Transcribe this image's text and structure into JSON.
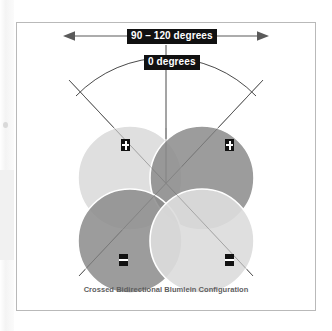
{
  "figure": {
    "caption": "Crossed Bidirectional Blumlein Configuration",
    "labels": {
      "angle_range": "90 – 120 degrees",
      "zero_axis": "0 degrees"
    },
    "icons": {
      "left_arrow": "arrow-left-icon",
      "right_arrow": "arrow-right-icon",
      "arc": "arc-icon"
    },
    "polarity_markers": [
      {
        "id": "top-left",
        "sign": "+",
        "name": "plus-marker"
      },
      {
        "id": "top-right",
        "sign": "+",
        "name": "plus-marker"
      },
      {
        "id": "bottom-left",
        "sign": "−",
        "name": "minus-marker"
      },
      {
        "id": "bottom-right",
        "sign": "−",
        "name": "minus-marker"
      }
    ],
    "lobes": [
      {
        "id": "top-left",
        "shade": "light",
        "color": "#dcdcdc"
      },
      {
        "id": "top-right",
        "shade": "dark",
        "color": "#8c8c8c"
      },
      {
        "id": "bottom-left",
        "shade": "dark",
        "color": "#8c8c8c"
      },
      {
        "id": "bottom-right",
        "shade": "light",
        "color": "#dcdcdc"
      }
    ],
    "colors": {
      "frame_border": "#b9b9b9",
      "label_background": "#111111",
      "label_text": "#ffffff",
      "caption_text": "#5e5e5e",
      "line": "#4a4a4a",
      "lobe_outline": "#ffffff",
      "page_background": "#ffffff"
    }
  }
}
